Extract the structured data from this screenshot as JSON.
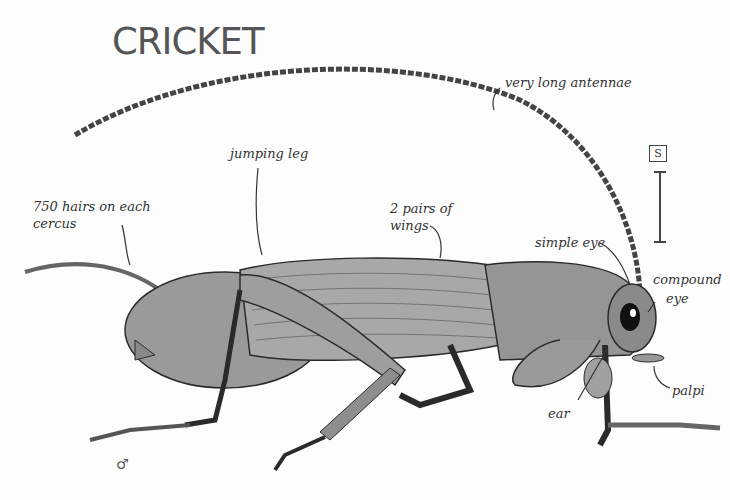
{
  "title": "CRICKET",
  "labels": {
    "antennae": "very long antennae",
    "jumping_leg": "jumping leg",
    "cercus_line1": "750 hairs on each",
    "cercus_line2": "cercus",
    "wings_line1": "2 pairs of",
    "wings_line2": "wings",
    "simple_eye": "simple eye",
    "compound_eye_line1": "compound",
    "compound_eye_line2": "eye",
    "ear": "ear",
    "palpi": "palpi"
  },
  "scale": {
    "symbol": "S"
  },
  "sex_symbol": "♂",
  "colors": {
    "body": "#8e8e8e",
    "body_light": "#b5b5b5",
    "outline": "#2a2a2a",
    "text": "#333333",
    "title": "#555555"
  }
}
